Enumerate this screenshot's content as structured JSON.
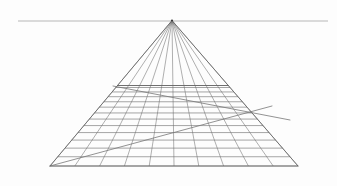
{
  "document": {
    "title": "One-Point Perspective Grid Construction",
    "kind": "line-drawing",
    "width": 337,
    "height": 186
  },
  "canvas": {
    "background_color": "#fdfdfd",
    "width": 337,
    "height": 186
  },
  "style": {
    "horizon_color": "#9a9a9a",
    "horizon_width": 0.7,
    "orthogonal_color": "#6e6e6e",
    "orthogonal_width": 0.55,
    "transverse_color": "#6a6a6a",
    "transverse_width": 0.6,
    "edge_color": "#5d5d5d",
    "edge_width": 0.75,
    "diagonal_color": "#777777",
    "diagonal_width": 0.8,
    "vp_marker_color": "#3a3a3a"
  },
  "horizon": {
    "label": "horizon line",
    "y": 21,
    "x_start": 18,
    "x_end": 328
  },
  "vanishing_point": {
    "label": "vanishing point",
    "x": 172,
    "y": 20.5,
    "marker_radius": 1.1
  },
  "ground_plane": {
    "label": "ground plane grid",
    "near_edge_y": 166,
    "far_edge_y": 85.5,
    "near_left_x": 50,
    "near_right_x": 298,
    "far_left_x": 113,
    "far_right_x": 233,
    "column_count": 10,
    "row_count": 13
  },
  "grid": {
    "orthogonals_label": "orthogonal lines converging to vanishing point",
    "transversals_label": "transverse lines receding in perspective",
    "near_edge_label": "near edge of ground plane",
    "far_edge_label": "far edge of ground plane",
    "left_edge_label": "left boundary orthogonal",
    "right_edge_label": "right boundary orthogonal",
    "orthogonal_near_x": [
      50,
      74.8,
      99.6,
      124.4,
      149.2,
      174,
      198.8,
      223.6,
      248.4,
      273.2,
      298
    ],
    "transverse_depths": [
      0,
      0.115,
      0.222,
      0.322,
      0.415,
      0.502,
      0.583,
      0.659,
      0.731,
      0.798,
      0.861,
      0.92,
      0.975,
      1.0
    ]
  },
  "diagonals": [
    {
      "name": "diagonal-measuring-line-lower",
      "label": "diagonal construction line from near-left corner",
      "x1": 50,
      "y1": 166,
      "x2": 272,
      "y2": 106
    },
    {
      "name": "diagonal-measuring-line-upper",
      "label": "diagonal construction line from far-left corner",
      "x1": 113,
      "y1": 86,
      "x2": 290,
      "y2": 120
    }
  ],
  "annotations": {
    "has_labels": false,
    "note": ""
  }
}
